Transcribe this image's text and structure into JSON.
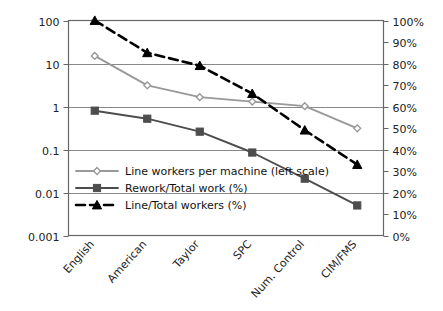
{
  "chart_data": {
    "type": "line",
    "title": "",
    "subtitle": "",
    "xlabel": "",
    "ylabel": "",
    "categories": [
      "English",
      "American",
      "Taylor",
      "SPC",
      "Num. Control",
      "CIM/FMS"
    ],
    "left_axis": {
      "scale": "log",
      "ticks": [
        "100",
        "10",
        "1",
        "0.1",
        "0.01",
        "0.001"
      ],
      "tick_values": [
        100,
        10,
        1,
        0.1,
        0.01,
        0.001
      ],
      "ylim": [
        0.001,
        100
      ],
      "label": ""
    },
    "right_axis": {
      "scale": "linear",
      "ticks": [
        "100%",
        "90%",
        "80%",
        "70%",
        "60%",
        "50%",
        "40%",
        "30%",
        "20%",
        "10%",
        "0%"
      ],
      "tick_values": [
        100,
        90,
        80,
        70,
        60,
        50,
        40,
        30,
        20,
        10,
        0
      ],
      "ylim": [
        0,
        100
      ],
      "label": ""
    },
    "grid": true,
    "legend_position": "inside-lower-left",
    "series": [
      {
        "name": "Line workers per machine (left scale)",
        "axis": "left",
        "marker": "diamond-open",
        "color": "#999999",
        "dashed": false,
        "values": [
          15,
          3.1,
          1.65,
          1.3,
          1.02,
          0.31
        ]
      },
      {
        "name": "Rework/Total work (%)",
        "axis": "left",
        "marker": "square-filled",
        "color": "#4d4d4d",
        "dashed": false,
        "values": [
          0.8,
          0.52,
          0.26,
          0.085,
          0.021,
          0.005
        ]
      },
      {
        "name": "Line/Total workers (%)",
        "axis": "right",
        "marker": "triangle-filled",
        "color": "#000000",
        "dashed": true,
        "values": [
          100,
          85,
          79,
          66,
          49,
          33
        ]
      }
    ]
  }
}
